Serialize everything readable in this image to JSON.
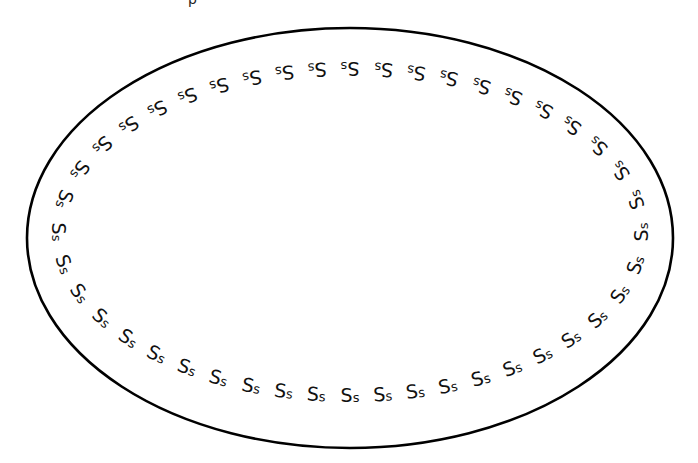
{
  "worksheet": {
    "letter_pair": {
      "upper": "S",
      "lower": "s"
    },
    "pair_count": 44,
    "top_fragment_text": "p",
    "colors": {
      "background": "#ffffff",
      "stroke": "#000000",
      "letters": "#111111"
    },
    "border_ellipse": {
      "cx": 350,
      "cy": 238,
      "rx": 323,
      "ry": 210,
      "stroke_width": 2.6
    },
    "letter_path": {
      "cx": 350,
      "cy": 232,
      "rx": 291,
      "ry": 163
    }
  }
}
